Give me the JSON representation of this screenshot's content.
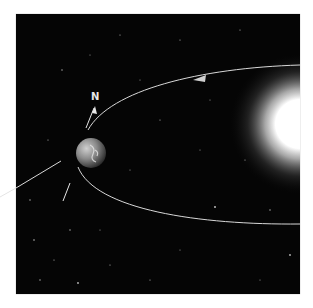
{
  "figure": {
    "labels": {
      "north": "N"
    },
    "colors": {
      "space": "#050505",
      "orbit": "#d8d8d8",
      "sun": "#ffffff",
      "background": "#ffffff"
    },
    "elements": {
      "earth": "earth-globe",
      "sun": "sun-glow",
      "orbit": "elliptical-orbit",
      "axis": "earth-rotation-axis"
    }
  }
}
